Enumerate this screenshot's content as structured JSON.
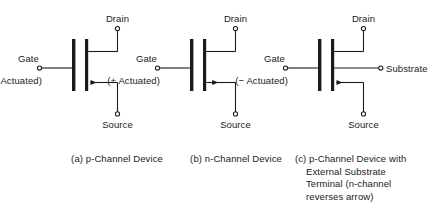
{
  "figure": {
    "title_text": "",
    "background_color": "#ffffff",
    "ink_color": "#1a1a1a",
    "terminal_marker": "open-circle"
  },
  "devices": [
    {
      "id": "device-a",
      "caption": "(a) p-Channel Device",
      "gate_label": "Gate",
      "gate_sublabel": "(− Actuated)",
      "drain_label": "Drain",
      "source_label": "Source",
      "substrate_label": null,
      "channel_type": "p-Channel",
      "arrow_direction": "left",
      "has_substrate_terminal": false
    },
    {
      "id": "device-b",
      "caption": "(b) n-Channel Device",
      "gate_label": "Gate",
      "gate_sublabel": "(+ Actuated)",
      "drain_label": "Drain",
      "source_label": "Source",
      "substrate_label": null,
      "channel_type": "n-Channel",
      "arrow_direction": "right",
      "has_substrate_terminal": false
    },
    {
      "id": "device-c",
      "caption_lines": [
        "(c) p-Channel Device with",
        "External Substrate",
        "Terminal (n-channel",
        "reverses arrow)"
      ],
      "gate_label": "Gate",
      "gate_sublabel": "(− Actuated)",
      "drain_label": "Drain",
      "source_label": "Source",
      "substrate_label": "Substrate",
      "channel_type": "p-Channel",
      "arrow_direction": "left",
      "has_substrate_terminal": true
    }
  ]
}
